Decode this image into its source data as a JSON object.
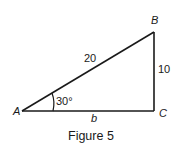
{
  "figure": {
    "caption": "Figure 5",
    "vertices": {
      "A": "A",
      "B": "B",
      "C": "C"
    },
    "sides": {
      "hypotenuse_AB": "20",
      "opposite_BC": "10",
      "adjacent_AC": "b"
    },
    "angle_A": "30°",
    "colors": {
      "stroke": "#1a1a1a",
      "background": "#ffffff"
    }
  }
}
